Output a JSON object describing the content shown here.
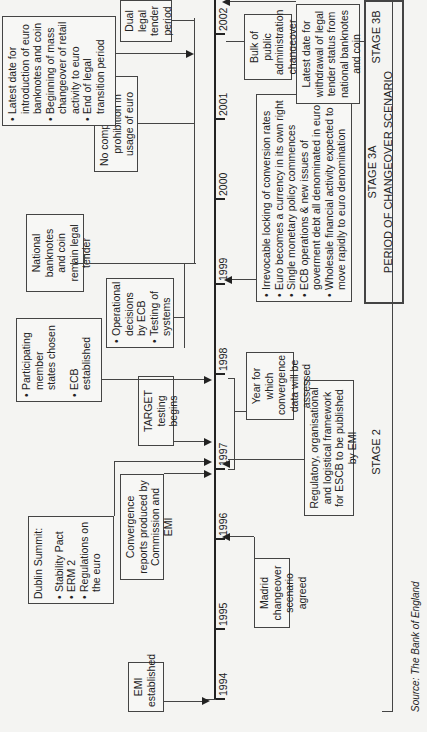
{
  "figure": {
    "orientation": "rotated 90 degrees counterclockwise",
    "source": "Source: The Bank of England"
  },
  "timeline": {
    "years": [
      "1994",
      "1995",
      "1996",
      "1997",
      "1998",
      "1999",
      "2000",
      "2001",
      "2002"
    ]
  },
  "events_above": {
    "emi": {
      "text": "EMI established"
    },
    "dublin": {
      "title": "Dublin Summit:",
      "items": [
        "Stability Pact",
        "ERM 2",
        "Regulations on the euro"
      ]
    },
    "convergence_reports": {
      "text": "Convergence reports produced by Commission and EMI"
    },
    "target": {
      "text": "TARGET testing begins"
    },
    "participating": {
      "items": [
        "Participating member states chosen",
        "ECB established"
      ]
    },
    "operational": {
      "items": [
        "Operational decisions by ECB",
        "Testing of systems"
      ]
    },
    "national": {
      "text": "National banknotes and coin remain legal tender"
    },
    "no_compulsion": {
      "text": "No compulsion/no prohibition in usage of euro"
    },
    "latest_date": {
      "items": [
        "Latest date for introduction of euro banknotes and coin",
        "Beginning of mass changeover of retail activity to euro",
        "End of legal transition period"
      ]
    },
    "dual": {
      "text": "Dual legal tender period"
    }
  },
  "events_below": {
    "madrid": {
      "text": "Madrid changeover scenario agreed"
    },
    "regulatory": {
      "text": "Regulatory, organisational and logistical framework for ESCB to be published by EMI"
    },
    "year_convergence": {
      "text": "Year for which convergence data will be assessed"
    },
    "irrevocable": {
      "items": [
        "Irrevocable locking of conversion rates",
        "Euro becomes a currency in its own right",
        "Single monetary policy commences",
        "ECB operations & new issues of goverment debt all denominated in euro",
        "Wholesale financial activity expected to move rapidly to euro denomination"
      ]
    },
    "bulk": {
      "text": "Bulk of public administration changeover"
    },
    "withdrawal": {
      "text": "Latest date for withdrawal of legal tender status from national banknotes and coin"
    }
  },
  "stages": {
    "stage2": "STAGE 2",
    "stage3a": "STAGE 3A",
    "period": "PERIOD OF CHANGEOVER SCENARIO",
    "stage3b": "STAGE 3B"
  }
}
